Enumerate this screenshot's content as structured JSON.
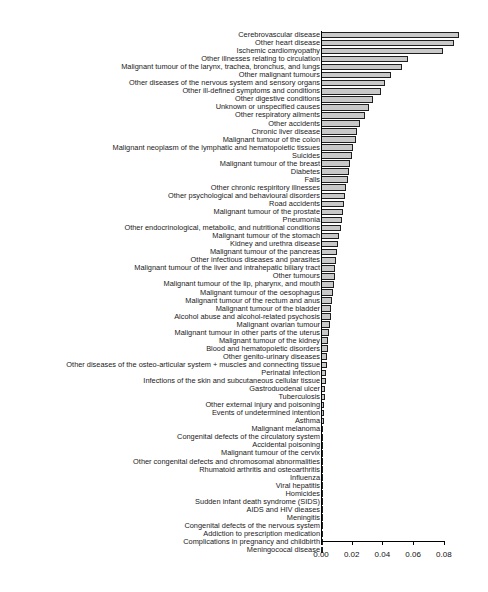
{
  "chart_data": {
    "type": "bar",
    "orientation": "horizontal",
    "title": "",
    "xlabel": "",
    "ylabel": "",
    "xlim": [
      0,
      0.0903
    ],
    "grid": false,
    "legend": null,
    "xticks": [
      "0.00",
      "0.02",
      "0.04",
      "0.06",
      "0.08"
    ],
    "xtick_values": [
      0.0,
      0.02,
      0.04,
      0.06,
      0.08
    ],
    "categories": [
      "Cerebrovascular disease",
      "Other heart disease",
      "Ischemic cardiomyopathy",
      "Other illnesses relating to circulation",
      "Malignant tumour of the larynx, trachea, bronchus, and lungs",
      "Other malignant tumours",
      "Other diseases of the nervous system and sensory organs",
      "Other ill-defined symptoms and conditions",
      "Other digestive conditions",
      "Unknown or unspecified causes",
      "Other respiratory ailments",
      "Other accidents",
      "Chronic liver disease",
      "Malignant tumour of the colon",
      "Malignant neoplasm of the lymphatic and hematopoietic tissues",
      "Suicides",
      "Malignant tumour of the breast",
      "Diabetes",
      "Falls",
      "Other chronic respiritory illnesses",
      "Other psychological and behavioural disorders",
      "Road accidents",
      "Malignant tumour of the prostate",
      "Pneumonia",
      "Other endocrinological, metabolic, and nutritional conditions",
      "Malignant tumour of the stomach",
      "Kidney and urethra disease",
      "Malignant tumour of the pancreas",
      "Other infectious diseases and parasites",
      "Malignant tumour of the liver and intrahepatic biliary tract",
      "Other tumours",
      "Malignant tumour of the lip, pharynx, and mouth",
      "Malignant tumour of the oesophagus",
      "Malignant tumour of the rectum and anus",
      "Malignant tumour of the bladder",
      "Alcohol abuse and alcohol-related psychosis",
      "Malignant ovarian tumour",
      "Malignant tumour in other parts of the uterus",
      "Malignant tumour of the kidney",
      "Blood and hematopoietic disorders",
      "Other genito-urinary diseases",
      "Other diseases of the osteo-articular system + muscles and connecting tissue",
      "Perinatal infection",
      "Infections of the skin and subcutaneous cellular tissue",
      "Gastroduodenal ulcer",
      "Tuberculosis",
      "Other external injury and poisoning",
      "Events of undetermined intention",
      "Asthma",
      "Malignant melanoma",
      "Congenital defects of the circulatory system",
      "Accidental poisoning",
      "Malignant tumour of the cervix",
      "Other congenital defects and chromosomal abnormalities",
      "Rhumatoid arthritis and osteoarthritis",
      "Influenza",
      "Viral hepatitis",
      "Homicides",
      "Sudden infant death syndrome (SIDS)",
      "AIDS and HIV dieases",
      "Meningitis",
      "Congenital defects of the nervous system",
      "Addiction to prescription medication",
      "Complications in pregnancy and childbirth",
      "Meningococal disease"
    ],
    "values": [
      0.0898,
      0.0865,
      0.0795,
      0.057,
      0.0528,
      0.0455,
      0.042,
      0.0388,
      0.034,
      0.031,
      0.0285,
      0.0255,
      0.0232,
      0.0225,
      0.021,
      0.02,
      0.019,
      0.0182,
      0.0173,
      0.0165,
      0.0158,
      0.015,
      0.0143,
      0.0136,
      0.0128,
      0.012,
      0.0113,
      0.0107,
      0.01,
      0.0094,
      0.0088,
      0.0082,
      0.0077,
      0.0072,
      0.0067,
      0.0062,
      0.0057,
      0.0052,
      0.0048,
      0.0044,
      0.004,
      0.0036,
      0.0033,
      0.003,
      0.0027,
      0.0024,
      0.0022,
      0.002,
      0.0018,
      0.0016,
      0.0014,
      0.0013,
      0.0012,
      0.0011,
      0.001,
      0.0009,
      0.0008,
      0.0007,
      0.0006,
      0.0005,
      0.0004,
      0.0003,
      0.0002,
      0.0002,
      0.0001
    ],
    "bar_fill_color": "#c9c9c9",
    "bar_edge_color": "#1f1f1f",
    "axis_color": "#000000"
  }
}
